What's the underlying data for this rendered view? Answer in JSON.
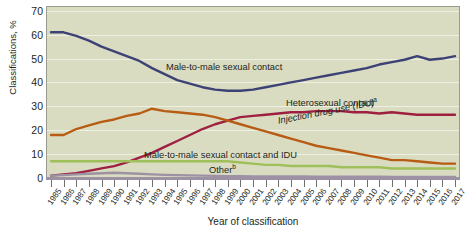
{
  "chart_data": {
    "type": "line",
    "title": "",
    "xlabel": "Year of classification",
    "ylabel": "Classifications, %",
    "ylim": [
      0,
      72
    ],
    "xlim": [
      1985,
      2017
    ],
    "yticks": [
      0,
      10,
      20,
      30,
      40,
      50,
      60,
      70
    ],
    "ytick_labels": [
      "0",
      "10",
      "20",
      "30",
      "40",
      "50",
      "60",
      "70"
    ],
    "grid": true,
    "legend_position": "inline-annotations",
    "categories": [
      "1985",
      "1986",
      "1987",
      "1988",
      "1989",
      "1990",
      "1991",
      "1992",
      "1993",
      "1994",
      "1995",
      "1996",
      "1997",
      "1998",
      "1999",
      "2000",
      "2001",
      "2002",
      "2003",
      "2004",
      "2005",
      "2006",
      "2007",
      "2008",
      "2009",
      "2010",
      "2011",
      "2012",
      "2013",
      "2014",
      "2015",
      "2016",
      "2017"
    ],
    "series": [
      {
        "name": "Male-to-male sexual contact",
        "color": "#3d4276",
        "values": [
          61,
          61,
          59.5,
          57.5,
          55,
          53,
          51,
          49,
          46,
          43.5,
          41,
          39.5,
          38,
          37,
          36.5,
          36.5,
          37,
          38,
          39,
          40,
          41,
          42,
          43,
          44,
          45,
          46,
          47.5,
          48.5,
          49.5,
          51,
          49.5,
          50,
          51
        ]
      },
      {
        "name": "Heterosexual contact",
        "name_superscript": "a",
        "color": "#9e2040",
        "values": [
          1,
          1.5,
          2,
          3,
          4,
          5,
          6.5,
          8.5,
          10.5,
          13,
          15.5,
          18,
          20.5,
          22.5,
          24,
          25.5,
          26,
          26.5,
          27,
          27.5,
          27.5,
          28,
          28,
          28,
          27.5,
          27.5,
          27,
          27.5,
          27,
          26.5,
          26.5,
          26.5,
          26.5
        ]
      },
      {
        "name": "Injection drug use (IDU)",
        "color": "#b85c14",
        "values": [
          18,
          18,
          20.5,
          22,
          23.5,
          24.5,
          26,
          27,
          29,
          28,
          27.5,
          27,
          26.5,
          25.5,
          24,
          22.5,
          21,
          19.5,
          18,
          16.5,
          15,
          13.5,
          12.5,
          11.5,
          10.5,
          9.5,
          8.5,
          7.5,
          7.5,
          7,
          6.5,
          6,
          6
        ]
      },
      {
        "name": "Male-to-male sexual contact and IDU",
        "color": "#9fbf5a",
        "values": [
          7,
          7,
          7,
          7,
          7,
          7,
          7,
          7,
          7,
          7,
          7,
          7,
          7,
          7,
          7,
          6.5,
          6,
          5.5,
          5.5,
          5,
          5,
          5,
          5,
          4.5,
          4.5,
          4.5,
          4.5,
          4,
          4,
          4,
          4,
          4,
          4
        ]
      },
      {
        "name": "Other",
        "name_superscript": "b",
        "color": "#9d92a3",
        "values": [
          1,
          1.2,
          1.5,
          1.8,
          2,
          2.2,
          2,
          1.8,
          1.5,
          1.3,
          1.2,
          1.1,
          1,
          0.9,
          0.8,
          0.8,
          0.7,
          0.7,
          0.6,
          0.6,
          0.6,
          0.5,
          0.5,
          0.5,
          0.5,
          0.5,
          0.5,
          0.4,
          0.4,
          0.4,
          0.4,
          0.4,
          0.4
        ]
      }
    ],
    "annotations": [
      {
        "text": "Male-to-male sexual contact",
        "superscript": ""
      },
      {
        "text": "Heterosexual contact",
        "superscript": "a"
      },
      {
        "text": "Injection drug use (IDU)",
        "superscript": ""
      },
      {
        "text": "Male-to-male sexual contact and IDU",
        "superscript": ""
      },
      {
        "text": "Other",
        "superscript": "b"
      }
    ],
    "plot_background_color": "#d9dcc0"
  }
}
